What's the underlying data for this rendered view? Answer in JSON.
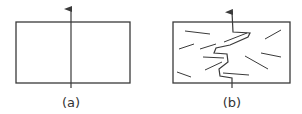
{
  "colors": {
    "stroke": "#3a3a3a",
    "background": "#ffffff"
  },
  "panels": [
    {
      "id": "a",
      "label": "(a)",
      "label_pos": [
        71,
        96
      ],
      "box": {
        "x": 16,
        "y": 22,
        "w": 114,
        "h": 61
      },
      "arrow": {
        "x": 71,
        "y_bottom": 88,
        "y_top": 7
      },
      "crack_path": [],
      "fibers": []
    },
    {
      "id": "b",
      "label": "(b)",
      "label_pos": [
        232,
        96
      ],
      "box": {
        "x": 173,
        "y": 22,
        "w": 117,
        "h": 61
      },
      "arrow": {
        "x": 232,
        "y_bottom": 88,
        "y_top": 7
      },
      "crack_path": [
        [
          232,
          88
        ],
        [
          232,
          78
        ],
        [
          220,
          76
        ],
        [
          219,
          69
        ],
        [
          228,
          62
        ],
        [
          227,
          54
        ],
        [
          214,
          53
        ],
        [
          216,
          48
        ],
        [
          230,
          45
        ],
        [
          248,
          37
        ],
        [
          250,
          33
        ],
        [
          233,
          32
        ],
        [
          232,
          12
        ]
      ],
      "fibers": [
        [
          [
            185,
            31
          ],
          [
            210,
            34
          ]
        ],
        [
          [
            179,
            49
          ],
          [
            194,
            44
          ]
        ],
        [
          [
            200,
            49
          ],
          [
            216,
            44
          ]
        ],
        [
          [
            203,
            57
          ],
          [
            224,
            58
          ]
        ],
        [
          [
            205,
            70
          ],
          [
            222,
            62
          ]
        ],
        [
          [
            177,
            72
          ],
          [
            191,
            77
          ]
        ],
        [
          [
            223,
            73
          ],
          [
            249,
            75
          ]
        ],
        [
          [
            265,
            39
          ],
          [
            281,
            30
          ]
        ],
        [
          [
            261,
            53
          ],
          [
            281,
            57
          ]
        ],
        [
          [
            245,
            56
          ],
          [
            268,
            69
          ]
        ],
        [
          [
            224,
            42
          ],
          [
            247,
            33
          ]
        ]
      ]
    }
  ]
}
